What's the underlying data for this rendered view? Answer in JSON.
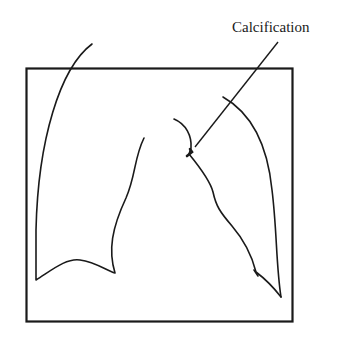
{
  "diagram": {
    "type": "chest-radiograph-sketch",
    "annotation": {
      "label": "Calcification",
      "points_to": "left hilar / aortic knob region"
    },
    "colors": {
      "background": "#ffffff",
      "stroke": "#1a1a1a"
    }
  }
}
